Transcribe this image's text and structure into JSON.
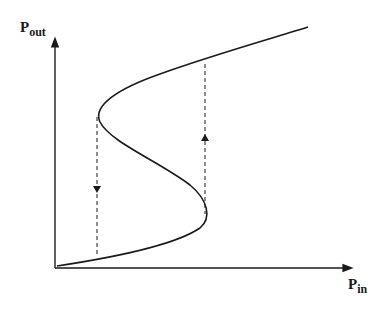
{
  "diagram": {
    "type": "bistability-hysteresis-curve",
    "y_axis": {
      "label": "P",
      "subscript": "out"
    },
    "x_axis": {
      "label": "P",
      "subscript": "in"
    },
    "curve": "S-shaped bistable transfer curve",
    "transitions": [
      {
        "name": "switch-down",
        "direction": "down",
        "style": "dashed"
      },
      {
        "name": "switch-up",
        "direction": "up",
        "style": "dashed"
      }
    ],
    "colors": {
      "line": "#1a1a1a",
      "background": "#ffffff"
    }
  }
}
